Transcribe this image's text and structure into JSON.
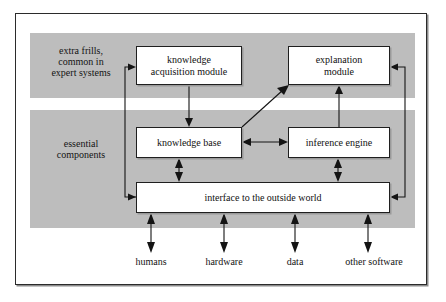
{
  "diagram": {
    "colors": {
      "band": "#bdbdbd",
      "box_fill": "#ffffff",
      "line": "#141414",
      "frame": "#2b2b2b"
    },
    "bands": [
      {
        "id": "frills",
        "caption": "extra frills,\ncommon in\nexpert systems"
      },
      {
        "id": "essential",
        "caption": "essential\ncomponents"
      }
    ],
    "captions": {
      "frills_line1": "extra frills,",
      "frills_line2": "common in",
      "frills_line3": "expert systems",
      "essential_line1": "essential",
      "essential_line2": "components"
    },
    "nodes": [
      {
        "id": "knowledge-acquisition-module",
        "line1": "knowledge",
        "line2": "acquisition module"
      },
      {
        "id": "explanation-module",
        "line1": "explanation",
        "line2": "module"
      },
      {
        "id": "knowledge-base",
        "line1": "knowledge base",
        "line2": ""
      },
      {
        "id": "inference-engine",
        "line1": "inference engine",
        "line2": ""
      },
      {
        "id": "interface-to-the-outside-world",
        "line1": "interface to the outside world",
        "line2": ""
      }
    ],
    "external_entities": [
      {
        "id": "humans",
        "label": "humans"
      },
      {
        "id": "hardware",
        "label": "hardware"
      },
      {
        "id": "data",
        "label": "data"
      },
      {
        "id": "other-software",
        "label": "other software"
      }
    ],
    "connections": [
      {
        "from": "interface-to-the-outside-world",
        "to": "knowledge-acquisition-module",
        "kind": "single"
      },
      {
        "from": "knowledge-acquisition-module",
        "to": "knowledge-base",
        "kind": "single"
      },
      {
        "from": "knowledge-base",
        "to": "explanation-module",
        "kind": "single-diagonal"
      },
      {
        "from": "inference-engine",
        "to": "explanation-module",
        "kind": "single"
      },
      {
        "from": "knowledge-base",
        "to": "inference-engine",
        "kind": "double"
      },
      {
        "from": "knowledge-base",
        "to": "interface-to-the-outside-world",
        "kind": "double"
      },
      {
        "from": "inference-engine",
        "to": "interface-to-the-outside-world",
        "kind": "double"
      },
      {
        "from": "explanation-module",
        "to": "interface-to-the-outside-world",
        "kind": "single-return"
      },
      {
        "from": "humans",
        "to": "interface-to-the-outside-world",
        "kind": "double"
      },
      {
        "from": "hardware",
        "to": "interface-to-the-outside-world",
        "kind": "double"
      },
      {
        "from": "data",
        "to": "interface-to-the-outside-world",
        "kind": "double"
      },
      {
        "from": "other-software",
        "to": "interface-to-the-outside-world",
        "kind": "double"
      }
    ]
  }
}
